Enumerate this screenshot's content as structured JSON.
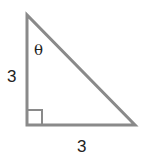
{
  "diagram": {
    "type": "right-triangle",
    "vertices": {
      "top": [
        27,
        15
      ],
      "right_angle": [
        27,
        125
      ],
      "bottom_right": [
        135,
        125
      ]
    },
    "labels": {
      "vertical_side": "3",
      "horizontal_side": "3",
      "angle": "θ"
    },
    "right_angle_marker": true,
    "colors": {
      "stroke": "#8a8a8a",
      "text": "#222222"
    }
  }
}
